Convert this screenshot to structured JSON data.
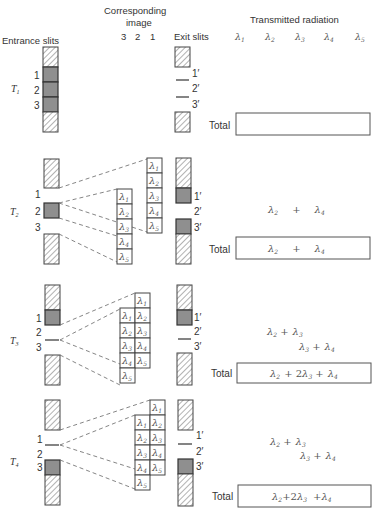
{
  "headers": {
    "entrance": "Entrance slits",
    "image_line1": "Corresponding",
    "image_line2": "image",
    "image_numbers": [
      "3",
      "2",
      "1"
    ],
    "exit": "Exit slits",
    "transmitted": "Transmitted radiation",
    "wavelengths": [
      "λ",
      "λ",
      "λ",
      "λ",
      "λ"
    ],
    "wavelength_subs": [
      "1",
      "2",
      "3",
      "4",
      "5"
    ]
  },
  "slit_labels": [
    "1",
    "2",
    "3"
  ],
  "exit_labels": [
    "1′",
    "2′",
    "3′"
  ],
  "total_label": "Total",
  "rows": [
    {
      "name": "T",
      "sub": "1",
      "open_entrance": [
        1,
        2,
        3
      ],
      "open_exit": [],
      "transmitted": [],
      "total": ""
    },
    {
      "name": "T",
      "sub": "2",
      "open_entrance": [
        2
      ],
      "open_exit": [
        1,
        3
      ],
      "image_columns": [
        [
          "λ1",
          "λ2",
          "λ3",
          "λ4",
          "λ5"
        ],
        [
          "λ1",
          "λ2",
          "λ3",
          "λ4",
          "λ5"
        ]
      ],
      "transmitted": [
        "λ2 + λ4"
      ],
      "total": "λ2 + λ4"
    },
    {
      "name": "T",
      "sub": "3",
      "open_entrance": [
        1
      ],
      "open_exit": [
        1
      ],
      "image_columns": [
        [
          "λ1",
          "λ2",
          "λ3",
          "λ4",
          "λ5"
        ],
        [
          "λ1",
          "λ2",
          "λ3",
          "λ4",
          "λ5"
        ]
      ],
      "transmitted": [
        "λ2 + λ3",
        "λ3 + λ4"
      ],
      "total": "λ2 + 2λ3 + λ4"
    },
    {
      "name": "T",
      "sub": "4",
      "open_entrance": [
        3
      ],
      "open_exit": [
        3
      ],
      "image_columns": [
        [
          "λ1",
          "λ2",
          "λ3",
          "λ4",
          "λ5"
        ],
        [
          "λ1",
          "λ2",
          "λ3",
          "λ4",
          "λ5"
        ]
      ],
      "transmitted": [
        "λ2 + λ3",
        "λ3 + λ4"
      ],
      "total": "λ2+2λ3 +λ4"
    }
  ]
}
